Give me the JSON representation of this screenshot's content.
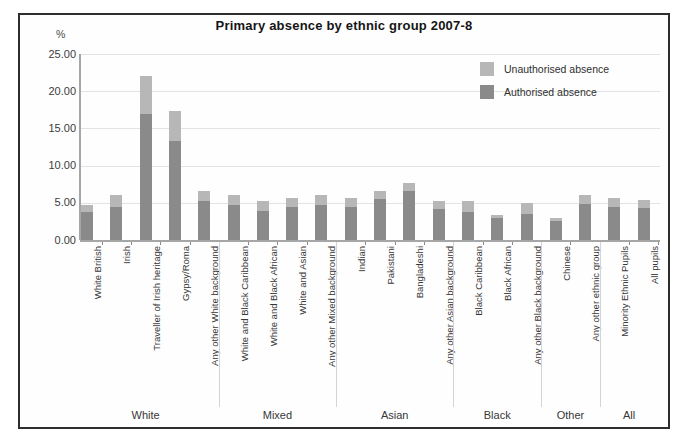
{
  "chart_data": {
    "type": "bar",
    "stacked": true,
    "title": "Primary absence by ethnic group 2007-8",
    "y_unit_label": "%",
    "xlabel": "",
    "ylabel": "%",
    "ylim": [
      0,
      25
    ],
    "ytick_step": 5,
    "ytick_labels": [
      "0.00",
      "5.00",
      "10.00",
      "15.00",
      "20.00",
      "25.00"
    ],
    "grid": true,
    "legend_position": "top-right-inside",
    "categories": [
      "White British",
      "Irish",
      "Traveller of Irish heritage",
      "Gypsy/Roma",
      "Any other White background",
      "White and Black Caribbean",
      "White and Black African",
      "White and Asian",
      "Any other Mixed background",
      "Indian",
      "Pakistani",
      "Bangladeshi",
      "Any other Asian background",
      "Black Caribbean",
      "Black African",
      "Any other Black background",
      "Chinese",
      "Any other ethnic group",
      "Minority Ethnic Pupils",
      "All pupils"
    ],
    "groups": [
      {
        "label": "White",
        "count": 5
      },
      {
        "label": "Mixed",
        "count": 4
      },
      {
        "label": "Asian",
        "count": 4
      },
      {
        "label": "Black",
        "count": 3
      },
      {
        "label": "Other",
        "count": 2
      },
      {
        "label": "All",
        "count": 2
      }
    ],
    "series": [
      {
        "name": "Authorised absence",
        "color": "#8a8a8a",
        "stack_order": "bottom",
        "values": [
          3.7,
          4.5,
          16.9,
          13.3,
          5.2,
          4.7,
          3.9,
          4.5,
          4.7,
          4.4,
          5.5,
          6.6,
          4.1,
          3.7,
          3.0,
          3.5,
          2.6,
          4.8,
          4.5,
          4.3
        ]
      },
      {
        "name": "Unauthorised absence",
        "color": "#b7b7b7",
        "stack_order": "top",
        "values": [
          1.0,
          1.5,
          5.1,
          4.1,
          1.4,
          1.4,
          1.3,
          1.2,
          1.4,
          1.2,
          1.1,
          1.0,
          1.1,
          1.5,
          0.3,
          1.5,
          0.4,
          1.3,
          1.1,
          1.1
        ]
      }
    ],
    "legend": [
      {
        "label": "Unauthorised absence",
        "color": "#b7b7b7"
      },
      {
        "label": "Authorised absence",
        "color": "#8a8a8a"
      }
    ],
    "colors": {
      "grid": "#e3e3e3",
      "axis": "#a6a6a6",
      "frame_border": "#2e2e2e"
    }
  }
}
